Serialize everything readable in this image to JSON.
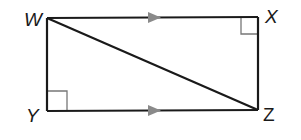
{
  "diagram": {
    "type": "geometry-rectangle-with-diagonal",
    "vertices": {
      "W": {
        "label": "W",
        "x": 47,
        "y": 18
      },
      "X": {
        "label": "X",
        "x": 258,
        "y": 17
      },
      "Y": {
        "label": "Y",
        "x": 47,
        "y": 111
      },
      "Z": {
        "label": "Z",
        "x": 258,
        "y": 110
      }
    },
    "segments": [
      "WX",
      "XZ",
      "ZY",
      "YW",
      "WZ"
    ],
    "parallel_marks": [
      "WX",
      "YZ"
    ],
    "right_angles": [
      "X",
      "Y"
    ],
    "colors": {
      "line": "#1a1a1a",
      "arrow": "#8a8a8a",
      "right_angle": "#777777"
    }
  }
}
